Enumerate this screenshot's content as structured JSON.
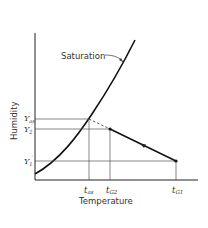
{
  "diagram": {
    "type": "psychrometric-adiabatic-saturation",
    "x_axis_label": "Temperature",
    "y_axis_label": "Humidity",
    "curve_label": "Saturation",
    "y_ticks": [
      {
        "id": "yas",
        "main": "Y",
        "sub": "as",
        "prime": "′"
      },
      {
        "id": "y2",
        "main": "Y",
        "sub": "2",
        "prime": "′"
      },
      {
        "id": "y1",
        "main": "Y",
        "sub": "1",
        "prime": "′"
      }
    ],
    "x_ticks": [
      {
        "id": "tas",
        "main": "t",
        "sub": "as"
      },
      {
        "id": "tg2",
        "main": "t",
        "sub": "G2"
      },
      {
        "id": "tg1",
        "main": "t",
        "sub": "G1"
      }
    ],
    "colors": {
      "line": "#222222",
      "grid": "#555555",
      "background": "#ffffff"
    }
  }
}
